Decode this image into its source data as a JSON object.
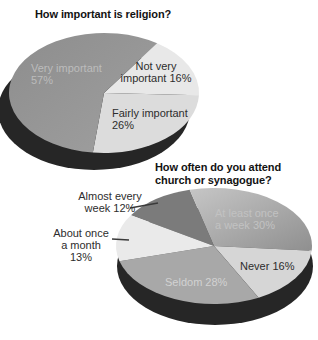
{
  "palette": {
    "background": "#ffffff",
    "title_text": "#121212",
    "dark_label_text": "#2d2d2d",
    "shadow": "#262626",
    "leader_line": "#3a3a3a"
  },
  "chart_data": [
    {
      "type": "pie",
      "title": "How important is religion?",
      "legend": "none",
      "labels_on_chart": true,
      "start_angle": -56,
      "slices": [
        {
          "label": "Not very important",
          "value": 16,
          "color": "#e8e8e8"
        },
        {
          "label": "Fairly important",
          "value": 26,
          "color": "#dcdcdc"
        },
        {
          "label": "Very important",
          "value": 57,
          "color": "#a0a0a0",
          "color2": "#8d8d8d"
        }
      ]
    },
    {
      "type": "pie",
      "title": "How often do you attend\nchurch or synagogue?",
      "legend": "none",
      "labels_on_chart": true,
      "start_angle": -148,
      "slices": [
        {
          "label": "Almost every week",
          "value": 12,
          "color": "#7b7b7b"
        },
        {
          "label": "At least once a week",
          "value": 30,
          "color": "#8f8f8f",
          "color2": "#c6c6c6"
        },
        {
          "label": "Never",
          "value": 16,
          "color": "#d6d6d6"
        },
        {
          "label": "Seldom",
          "value": 28,
          "color": "#a8a8a8"
        },
        {
          "label": "About once a month",
          "value": 13,
          "color": "#eaeaea"
        }
      ]
    }
  ],
  "labels": {
    "pie1_very": {
      "text": "Very important\n57%",
      "color": "#bcbcbc"
    },
    "pie1_not_very": {
      "text": "Not very\nimportant 16%",
      "color": "#2d2d2d"
    },
    "pie1_fairly": {
      "text": "Fairly important\n26%",
      "color": "#2d2d2d"
    },
    "pie2_almost": {
      "text": "Almost every\nweek 12%",
      "color": "#2d2d2d"
    },
    "pie2_about": {
      "text": "About once\na month\n13%",
      "color": "#2d2d2d"
    },
    "pie2_at_least": {
      "text": "At least once\na week 30%",
      "color": "#c2c2c2"
    },
    "pie2_never": {
      "text": "Never 16%",
      "color": "#2d2d2d"
    },
    "pie2_seldom": {
      "text": "Seldom 28%",
      "color": "#d2d2d2"
    }
  }
}
